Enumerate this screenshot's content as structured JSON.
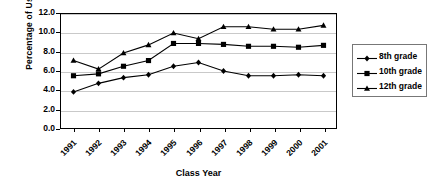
{
  "chart_data": {
    "type": "line",
    "title": "",
    "xlabel": "Class Year",
    "ylabel": "Percentage of Use",
    "categories": [
      "1991",
      "1992",
      "1993",
      "1994",
      "1995",
      "1996",
      "1997",
      "1998",
      "1999",
      "2000",
      "2001"
    ],
    "ylim": [
      0.0,
      12.0
    ],
    "ytick_step": 2.0,
    "yticks": [
      "12.0",
      "10.0",
      "8.0",
      "6.0",
      "4.0",
      "2.0",
      "0.0"
    ],
    "ytick_values": [
      12.0,
      10.0,
      8.0,
      6.0,
      4.0,
      2.0,
      0.0
    ],
    "grid": "horizontal",
    "legend_position": "right",
    "series": [
      {
        "name": "8th grade",
        "marker": "diamond",
        "color": "#000000",
        "values": [
          3.8,
          4.7,
          5.3,
          5.6,
          6.5,
          6.9,
          6.0,
          5.5,
          5.5,
          5.6,
          5.5
        ]
      },
      {
        "name": "10th grade",
        "marker": "square",
        "color": "#000000",
        "values": [
          5.5,
          5.7,
          6.5,
          7.1,
          8.9,
          8.9,
          8.8,
          8.6,
          8.6,
          8.5,
          8.7
        ]
      },
      {
        "name": "12th grade",
        "marker": "triangle",
        "color": "#000000",
        "values": [
          7.1,
          6.2,
          7.9,
          8.75,
          10.0,
          9.4,
          10.65,
          10.65,
          10.4,
          10.4,
          10.8
        ]
      }
    ]
  },
  "legend": {
    "items": [
      {
        "label": "8th grade",
        "marker": "diamond"
      },
      {
        "label": "10th grade",
        "marker": "square"
      },
      {
        "label": "12th grade",
        "marker": "triangle"
      }
    ]
  },
  "style": {
    "grid_color": "#c9c9c9",
    "axis_color": "#000000",
    "series_color": "#000000",
    "background": "#ffffff"
  }
}
